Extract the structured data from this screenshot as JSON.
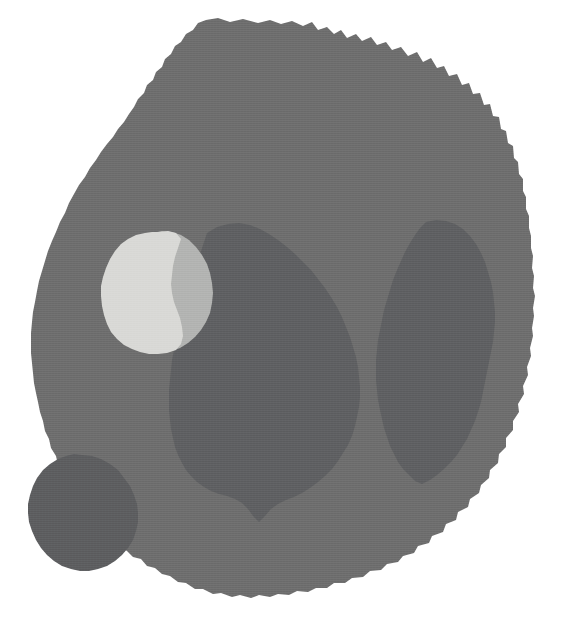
{
  "image": {
    "kind": "grayscale-segmentation-slice",
    "width": 576,
    "height": 639,
    "background_color": "#ffffff",
    "alt_text": "Grayscale cross-sectional scan slice showing a large rounded tissue mass with several segmented interior regions and one bright high-intensity lesion"
  },
  "regions": [
    {
      "id": "body-mass",
      "label": "Primary tissue mass",
      "color": "#6e6e6e",
      "intensity": 110,
      "role": "outer-body",
      "approx_center": [
        285,
        305
      ],
      "approx_area_px": 226000
    },
    {
      "id": "central-structure",
      "label": "Central dark structure",
      "color": "#5f6062",
      "intensity": 96,
      "role": "interior-segment",
      "approx_center": [
        288,
        380
      ],
      "approx_area_px": 59000
    },
    {
      "id": "right-structure",
      "label": "Right lateral dark structure",
      "color": "#5f6062",
      "intensity": 96,
      "role": "interior-segment",
      "approx_center": [
        440,
        375
      ],
      "approx_area_px": 33000
    },
    {
      "id": "lower-left-nodule",
      "label": "Lower-left rounded nodule",
      "color": "#5d5e60",
      "intensity": 94,
      "role": "interior-segment",
      "approx_center": [
        82,
        515
      ],
      "approx_area_px": 12500
    },
    {
      "id": "bright-lesion-core",
      "label": "Bright lesion core",
      "color": "#d9d9d6",
      "intensity": 217,
      "role": "high-intensity-lesion",
      "approx_center": [
        148,
        295
      ],
      "approx_area_px": 6400
    },
    {
      "id": "bright-lesion-halo",
      "label": "Bright lesion margin",
      "color": "#b3b4b2",
      "intensity": 179,
      "role": "lesion-margin",
      "approx_center": [
        193,
        295
      ],
      "approx_area_px": 3400
    }
  ],
  "palette": {
    "background": "#ffffff",
    "body": "#6e6e6e",
    "interior_dark": "#5f6062",
    "nodule_dark": "#5d5e60",
    "lesion_bright": "#d9d9d6",
    "lesion_mid": "#b3b4b2"
  }
}
